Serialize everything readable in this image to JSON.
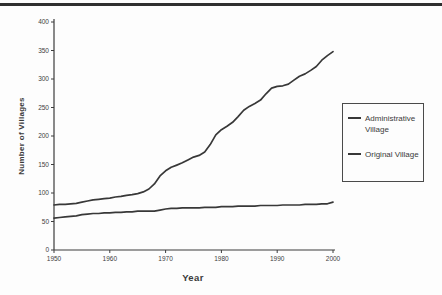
{
  "page": {
    "background": "#fdfdfd",
    "top_rule_color": "#2f2f2f"
  },
  "chart_data": {
    "type": "line",
    "title": "",
    "xlabel": "Year",
    "ylabel": "Number of Villages",
    "xlim": [
      1950,
      2000
    ],
    "ylim": [
      0,
      400
    ],
    "xticks": [
      "1950",
      "1960",
      "1970",
      "1980",
      "1990",
      "2000"
    ],
    "yticks": [
      "0",
      "50",
      "100",
      "150",
      "200",
      "250",
      "300",
      "350",
      "400"
    ],
    "grid": false,
    "legend_position": "right-middle",
    "axis_color": "#3c3c3c",
    "line_color": "#383838",
    "x": [
      1950,
      1951,
      1952,
      1953,
      1954,
      1955,
      1956,
      1957,
      1958,
      1959,
      1960,
      1961,
      1962,
      1963,
      1964,
      1965,
      1966,
      1967,
      1968,
      1969,
      1970,
      1971,
      1972,
      1973,
      1974,
      1975,
      1976,
      1977,
      1978,
      1979,
      1980,
      1981,
      1982,
      1983,
      1984,
      1985,
      1986,
      1987,
      1988,
      1989,
      1990,
      1991,
      1992,
      1993,
      1994,
      1995,
      1996,
      1997,
      1998,
      1999,
      2000
    ],
    "series": [
      {
        "name": "Administrative Village",
        "values": [
          79,
          80,
          80,
          81,
          82,
          84,
          86,
          88,
          89,
          90,
          91,
          93,
          94,
          96,
          97,
          99,
          102,
          107,
          116,
          130,
          139,
          145,
          149,
          153,
          158,
          163,
          166,
          172,
          185,
          202,
          211,
          217,
          224,
          234,
          245,
          252,
          257,
          263,
          274,
          284,
          287,
          288,
          291,
          298,
          305,
          309,
          315,
          322,
          333,
          341,
          348
        ]
      },
      {
        "name": "Original Village",
        "values": [
          56,
          57,
          58,
          59,
          60,
          62,
          63,
          64,
          64,
          65,
          65,
          66,
          66,
          67,
          67,
          68,
          68,
          68,
          68,
          70,
          72,
          73,
          73,
          74,
          74,
          74,
          74,
          75,
          75,
          75,
          76,
          76,
          76,
          77,
          77,
          77,
          77,
          78,
          78,
          78,
          78,
          79,
          79,
          79,
          79,
          80,
          80,
          80,
          81,
          81,
          84
        ]
      }
    ]
  }
}
